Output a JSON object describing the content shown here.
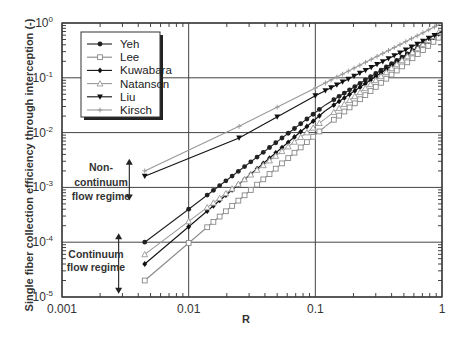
{
  "chart_data": {
    "type": "line",
    "title": "",
    "xlabel": "R",
    "ylabel": "Single fiber collection efficiency through interception (-)",
    "xscale": "log",
    "yscale": "log",
    "xlim": [
      0.001,
      1
    ],
    "ylim": [
      1e-05,
      1
    ],
    "grid": true,
    "legend_position": "top-left",
    "x_ticks": [
      {
        "value": 0.001,
        "label": "0.001"
      },
      {
        "value": 0.01,
        "label": "0.01"
      },
      {
        "value": 0.1,
        "label": "0.1"
      },
      {
        "value": 1,
        "label": "1"
      }
    ],
    "y_ticks": [
      {
        "value": 1,
        "base": "10",
        "exp": "0"
      },
      {
        "value": 0.1,
        "base": "10",
        "exp": "-1"
      },
      {
        "value": 0.01,
        "base": "10",
        "exp": "-2"
      },
      {
        "value": 0.001,
        "base": "10",
        "exp": "-3"
      },
      {
        "value": 0.0001,
        "base": "10",
        "exp": "-4"
      },
      {
        "value": 1e-05,
        "base": "10",
        "exp": "-5"
      }
    ],
    "series": [
      {
        "name": "Yeh",
        "marker": "circle",
        "color": "#222222",
        "x": [
          0.0045,
          0.01,
          0.12
        ],
        "y": [
          0.0001,
          0.0004,
          0.032
        ],
        "x_to_1": [
          0.12,
          1
        ],
        "y_to_1": [
          0.032,
          0.68
        ]
      },
      {
        "name": "Lee",
        "marker": "square",
        "color": "#888888",
        "x": [
          0.0045,
          0.12
        ],
        "y": [
          2e-05,
          0.013
        ],
        "x_to_1": [
          0.12,
          1
        ],
        "y_to_1": [
          0.013,
          0.6
        ]
      },
      {
        "name": "Kuwabara",
        "marker": "diamond",
        "color": "#111111",
        "x": [
          0.0045,
          0.12
        ],
        "y": [
          4e-05,
          0.025
        ],
        "x_to_1": [
          0.12,
          1
        ],
        "y_to_1": [
          0.025,
          0.7
        ]
      },
      {
        "name": "Natanson",
        "marker": "triangle-up",
        "color": "#999999",
        "x": [
          0.0045,
          0.12
        ],
        "y": [
          6e-05,
          0.018
        ],
        "x_to_1": [
          0.12,
          1
        ],
        "y_to_1": [
          0.018,
          0.75
        ]
      },
      {
        "name": "Liu",
        "marker": "triangle-down",
        "color": "#111111",
        "x": [
          0.0045,
          0.025,
          0.1,
          1
        ],
        "y": [
          0.0016,
          0.008,
          0.047,
          0.7
        ]
      },
      {
        "name": "Kirsch",
        "marker": "cross",
        "color": "#999999",
        "x": [
          0.0045,
          0.025,
          0.1,
          1
        ],
        "y": [
          0.002,
          0.013,
          0.065,
          1.0
        ]
      }
    ],
    "annotations": [
      {
        "lines": [
          "Non-",
          "continuum",
          "flow regime"
        ],
        "arrow_x": 0.0034,
        "arrow_y": [
          0.0032,
          0.0006
        ]
      },
      {
        "lines": [
          "Continuum",
          "flow regime"
        ],
        "arrow_x": 0.0028,
        "arrow_y": [
          0.00014,
          1.2e-05
        ]
      }
    ]
  }
}
